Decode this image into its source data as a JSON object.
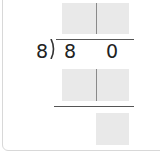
{
  "problem": {
    "divisor": "8",
    "dividend_digits": [
      "8",
      "0"
    ],
    "quotient_boxes": [
      "",
      ""
    ],
    "subtract_boxes": [
      "",
      ""
    ],
    "remainder_box": ""
  },
  "colors": {
    "box_fill": "#e9e9e9",
    "line": "#555555",
    "text": "#222222"
  }
}
